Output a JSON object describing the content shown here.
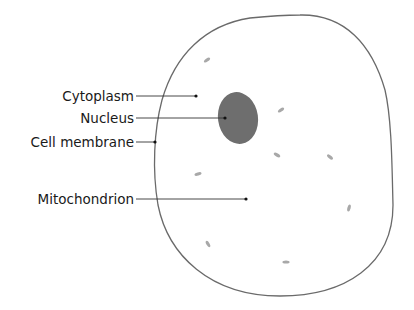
{
  "diagram": {
    "colors": {
      "background": "#ffffff",
      "outline": "#6a6a6a",
      "nucleus": "#6e6e6e",
      "mitochondria": "#a8a8a8",
      "leader_line": "#333333",
      "text": "#1a1a1a"
    },
    "labels": [
      {
        "text": "Cytoplasm",
        "x": 136,
        "y": 96,
        "line_end_x": 196
      },
      {
        "text": "Nucleus",
        "x": 136,
        "y": 118,
        "line_end_x": 225
      },
      {
        "text": "Cell membrane",
        "x": 136,
        "y": 142,
        "line_end_x": 155
      },
      {
        "text": "Mitochondrion",
        "x": 136,
        "y": 199,
        "line_end_x": 246
      }
    ],
    "nucleus": {
      "cx": 238,
      "cy": 118,
      "rx": 20,
      "ry": 26
    },
    "mitochondria": [
      {
        "cx": 207,
        "cy": 60,
        "angle": -35
      },
      {
        "cx": 281,
        "cy": 110,
        "angle": -35
      },
      {
        "cx": 277,
        "cy": 155,
        "angle": 30
      },
      {
        "cx": 330,
        "cy": 157,
        "angle": 40
      },
      {
        "cx": 198,
        "cy": 174,
        "angle": -15
      },
      {
        "cx": 349,
        "cy": 208,
        "angle": -75
      },
      {
        "cx": 208,
        "cy": 244,
        "angle": 60
      },
      {
        "cx": 286,
        "cy": 262,
        "angle": 0
      }
    ]
  }
}
